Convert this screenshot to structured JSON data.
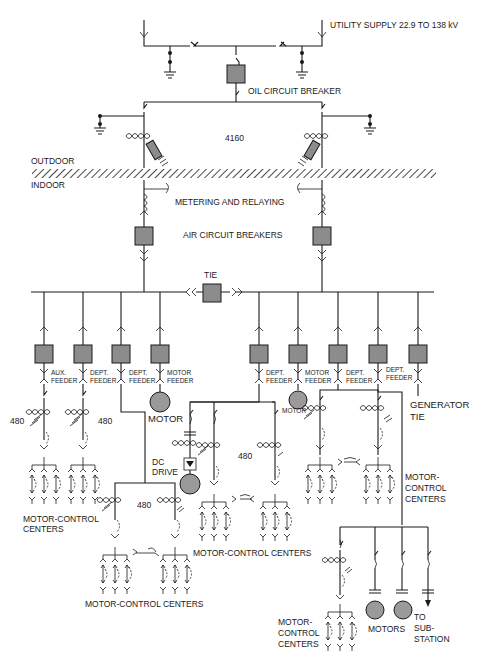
{
  "diagram": {
    "labels": {
      "utility_supply": "UTILITY SUPPLY 22.9 TO 138 kV",
      "oil_circuit_breaker": "OIL CIRCUIT BREAKER",
      "voltage_4160": "4160",
      "outdoor": "OUTDOOR",
      "indoor": "INDOOR",
      "metering": "METERING AND RELAYING",
      "air_breakers": "AIR CIRCUIT BREAKERS",
      "tie": "TIE",
      "generator_tie_1": "GENERATOR",
      "generator_tie_2": "TIE",
      "motor_1": "MOTOR",
      "motor_2": "MOTOR",
      "dc_drive_1": "DC",
      "dc_drive_2": "DRIVE",
      "v480_a": "480",
      "v480_b": "480",
      "v480_c": "480",
      "v480_d": "480",
      "mcc_left_1": "MOTOR-CONTROL",
      "mcc_left_2": "CENTERS",
      "mcc_mid": "MOTOR-CONTROL CENTERS",
      "mcc_bottom": "MOTOR-CONTROL CENTERS",
      "mcc_right_1": "MOTOR-",
      "mcc_right_2": "CONTROL",
      "mcc_right_3": "CENTERS",
      "mcc_br_1": "MOTOR-",
      "mcc_br_2": "CONTROL",
      "mcc_br_3": "CENTERS",
      "motors": "MOTORS",
      "to_sub_1": "TO",
      "to_sub_2": "SUB-",
      "to_sub_3": "STATION"
    },
    "feeders_left": [
      {
        "line1": "AUX.",
        "line2": "FEEDER"
      },
      {
        "line1": "DEPT.",
        "line2": "FEEDER"
      },
      {
        "line1": "DEPT.",
        "line2": "FEEDER"
      },
      {
        "line1": "MOTOR",
        "line2": "FEEDER"
      }
    ],
    "feeders_right": [
      {
        "line1": "DEPT.",
        "line2": "FEEDER"
      },
      {
        "line1": "MOTOR",
        "line2": "FEEDER"
      },
      {
        "line1": "DEPT.",
        "line2": "FEEDER"
      },
      {
        "line1": "DEPT.",
        "line2": "FEEDER"
      }
    ]
  }
}
